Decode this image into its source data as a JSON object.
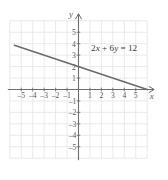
{
  "figure": {
    "name": "coordinate-plane-linear-graph",
    "background_color": "#ffffff"
  },
  "chart_data": {
    "type": "line",
    "title": "",
    "subtitle": "",
    "xlabel": "x",
    "ylabel": "y",
    "xlim": [
      -6,
      6
    ],
    "ylim": [
      -6,
      6
    ],
    "grid": true,
    "grid_color": "#e4e4e6",
    "axis_color": "#6e6e70",
    "legend": "none",
    "annotations": [
      {
        "name": "equation-label",
        "text": "2x + 6y = 12",
        "parts": [
          {
            "text": "2",
            "italic": false
          },
          {
            "text": "x",
            "italic": true
          },
          {
            "text": " + 6",
            "italic": false
          },
          {
            "text": "y",
            "italic": true
          },
          {
            "text": " = 12",
            "italic": false
          }
        ],
        "x": 1.1,
        "y": 3.35
      }
    ],
    "series": [
      {
        "name": "2x + 6y = 12",
        "equation": "2x + 6y = 12",
        "slope": -0.3333333333,
        "intercept": 2,
        "color": "#6a6a6c",
        "x": [
          -5.6,
          6.0
        ],
        "y": [
          3.8667,
          0.0
        ],
        "points_of_interest": [
          {
            "label": "y-intercept",
            "x": 0,
            "y": 2
          },
          {
            "label": "x-intercept",
            "x": 6,
            "y": 0
          }
        ]
      }
    ],
    "x_ticks": [
      -5,
      -4,
      -3,
      -2,
      -1,
      1,
      2,
      3,
      4,
      5
    ],
    "x_tick_labels": [
      "-5",
      "-4",
      "-3",
      "-2",
      "-1",
      "1",
      "2",
      "3",
      "4",
      "5"
    ],
    "y_ticks": [
      5,
      4,
      3,
      2,
      1,
      -1,
      -2,
      -3,
      -4,
      -5
    ],
    "y_tick_labels": [
      "5",
      "4",
      "3",
      "2",
      "1",
      "-1",
      "-2",
      "-3",
      "-4",
      "-5"
    ]
  },
  "axes": {
    "x_axis_name": "x",
    "y_axis_name": "y"
  }
}
